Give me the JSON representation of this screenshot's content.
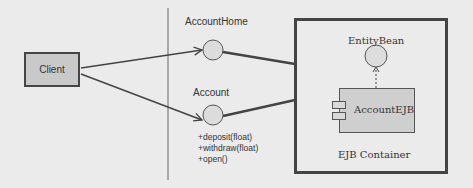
{
  "diagram": {
    "type": "uml-component-diagram",
    "nodes": {
      "client": {
        "label": "Client"
      },
      "account_home": {
        "label": "AccountHome",
        "kind": "interface"
      },
      "account": {
        "label": "Account",
        "kind": "interface",
        "operations": [
          "+deposit(float)",
          "+withdraw(float)",
          "+open()"
        ]
      },
      "entity_bean": {
        "label": "EntityBean",
        "kind": "interface"
      },
      "account_ejb": {
        "label": "AccountEJB",
        "kind": "component"
      },
      "ejb_container": {
        "label": "EJB Container",
        "kind": "container"
      }
    },
    "edges": [
      {
        "from": "Client",
        "to": "AccountHome",
        "style": "arrow"
      },
      {
        "from": "Client",
        "to": "Account",
        "style": "arrow"
      },
      {
        "from": "AccountHome",
        "to": "EJB Container",
        "style": "solid-thick"
      },
      {
        "from": "Account",
        "to": "EJB Container",
        "style": "solid-thick"
      },
      {
        "from": "AccountEJB",
        "to": "EntityBean",
        "style": "dashed-realization"
      }
    ],
    "colors": {
      "background": "#ebebeb",
      "stroke": "#444444",
      "fill": "#cfcfcf",
      "interface_fill": "#dcdcdc"
    }
  }
}
